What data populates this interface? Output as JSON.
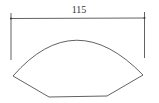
{
  "diagram": {
    "dimension": {
      "label": "115"
    },
    "colors": {
      "stroke": "#3a3a3a",
      "background": "#ffffff"
    }
  }
}
